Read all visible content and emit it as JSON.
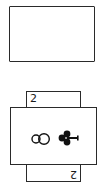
{
  "foundation_slot": {
    "label": ""
  },
  "card_under": {
    "rank": "2",
    "rank_rotated": "2",
    "suit": "clubs"
  },
  "card_over": {
    "orientation": "horizontal",
    "pips": [
      "club-outline",
      "club-solid"
    ]
  }
}
